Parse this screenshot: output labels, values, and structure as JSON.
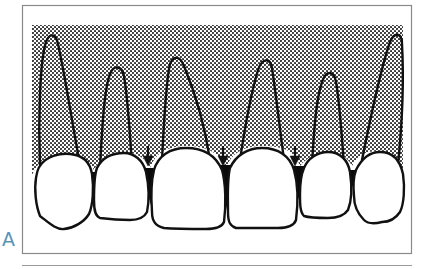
{
  "figure": {
    "panel_label": "A",
    "colors": {
      "frame": "#8a8a8a",
      "outline": "#111111",
      "stipple_dot": "#2a2a2a",
      "stipple_bg": "#ffffff",
      "crown_fill": "#ffffff",
      "black_triangle": "#0a0a0a",
      "panel_label": "#5a93b5"
    },
    "teeth_count": 6,
    "arrows_count": 3,
    "black_triangles_count": 5
  }
}
